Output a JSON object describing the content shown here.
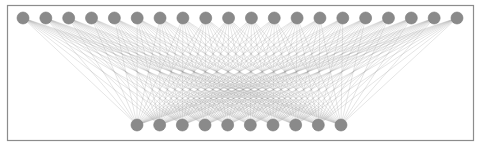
{
  "diagram": {
    "type": "bipartite-fully-connected-graph",
    "layers": [
      {
        "name": "top-layer",
        "node_count": 20
      },
      {
        "name": "bottom-layer",
        "node_count": 10
      }
    ],
    "edges": "all-to-all",
    "edge_count": 200,
    "colors": {
      "node": "#8a8a8a",
      "node_stroke": "#7a7a7a",
      "edge": "#9a9a9a",
      "frame": "#8c8c8c",
      "background": "#ffffff"
    }
  }
}
